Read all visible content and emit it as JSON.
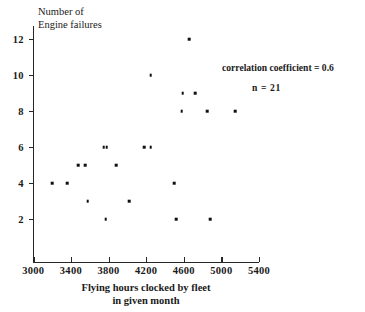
{
  "chart_data": {
    "type": "scatter",
    "title": "",
    "xlabel": "Flying hours clocked by fleet in given month",
    "xlabel_line1": "Flying hours clocked by fleet",
    "xlabel_line2": "in given month",
    "ylabel": "Number of Engine failures",
    "ylabel_line1": "Number of",
    "ylabel_line2": "Engine failures",
    "xlim": [
      3000,
      5400
    ],
    "ylim": [
      0,
      12.8
    ],
    "xticks": [
      3000,
      3400,
      3800,
      4200,
      4600,
      5000,
      5400
    ],
    "yticks": [
      2,
      4,
      6,
      8,
      10,
      12
    ],
    "grid": false,
    "legend": "none",
    "marker_color": "#101010",
    "axis_color": "#262626",
    "points": [
      {
        "x": 3200,
        "y": 4
      },
      {
        "x": 3360,
        "y": 4
      },
      {
        "x": 3480,
        "y": 5
      },
      {
        "x": 3550,
        "y": 5
      },
      {
        "x": 3580,
        "y": 3
      },
      {
        "x": 3750,
        "y": 6
      },
      {
        "x": 3780,
        "y": 6
      },
      {
        "x": 3770,
        "y": 2
      },
      {
        "x": 3880,
        "y": 5
      },
      {
        "x": 4020,
        "y": 3
      },
      {
        "x": 4180,
        "y": 6
      },
      {
        "x": 4250,
        "y": 6
      },
      {
        "x": 4250,
        "y": 10
      },
      {
        "x": 4500,
        "y": 4
      },
      {
        "x": 4520,
        "y": 2
      },
      {
        "x": 4580,
        "y": 8
      },
      {
        "x": 4590,
        "y": 9
      },
      {
        "x": 4660,
        "y": 12
      },
      {
        "x": 4720,
        "y": 9
      },
      {
        "x": 4850,
        "y": 8
      },
      {
        "x": 4880,
        "y": 2
      },
      {
        "x": 5150,
        "y": 8
      }
    ],
    "annotations": [
      {
        "id": "correlation",
        "text": "correlation coefficient = 0.6"
      },
      {
        "id": "n",
        "text": "n = 21"
      }
    ]
  }
}
